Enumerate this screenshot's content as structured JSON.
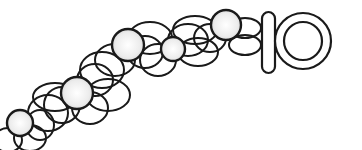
{
  "illustration": {
    "subject": "pearl necklace with toggle clasp",
    "colors": {
      "stroke": "#1a1a1a",
      "pearl_fill_center": "#ffffff",
      "pearl_fill_edge": "#d9d9d9",
      "background": "#ffffff"
    },
    "pearls": [
      {
        "cx": 20,
        "cy": 123,
        "r": 13
      },
      {
        "cx": 77,
        "cy": 93,
        "r": 16
      },
      {
        "cx": 128,
        "cy": 45,
        "r": 16
      },
      {
        "cx": 173,
        "cy": 49,
        "r": 12
      },
      {
        "cx": 226,
        "cy": 25,
        "r": 15
      }
    ],
    "links": [
      {
        "cx": 8,
        "cy": 140,
        "rx": 14,
        "ry": 12
      },
      {
        "cx": 30,
        "cy": 138,
        "rx": 16,
        "ry": 13
      },
      {
        "cx": 40,
        "cy": 125,
        "rx": 14,
        "ry": 15
      },
      {
        "cx": 48,
        "cy": 113,
        "rx": 20,
        "ry": 18
      },
      {
        "cx": 62,
        "cy": 105,
        "rx": 18,
        "ry": 18
      },
      {
        "cx": 55,
        "cy": 97,
        "rx": 22,
        "ry": 14
      },
      {
        "cx": 90,
        "cy": 108,
        "rx": 18,
        "ry": 16
      },
      {
        "cx": 95,
        "cy": 80,
        "rx": 18,
        "ry": 16
      },
      {
        "cx": 102,
        "cy": 70,
        "rx": 22,
        "ry": 18
      },
      {
        "cx": 108,
        "cy": 95,
        "rx": 22,
        "ry": 16
      },
      {
        "cx": 115,
        "cy": 60,
        "rx": 20,
        "ry": 16
      },
      {
        "cx": 145,
        "cy": 52,
        "rx": 18,
        "ry": 16
      },
      {
        "cx": 150,
        "cy": 38,
        "rx": 22,
        "ry": 16
      },
      {
        "cx": 158,
        "cy": 60,
        "rx": 18,
        "ry": 16
      },
      {
        "cx": 188,
        "cy": 40,
        "rx": 20,
        "ry": 16
      },
      {
        "cx": 195,
        "cy": 30,
        "rx": 22,
        "ry": 14
      },
      {
        "cx": 198,
        "cy": 52,
        "rx": 20,
        "ry": 14
      },
      {
        "cx": 210,
        "cy": 38,
        "rx": 16,
        "ry": 14
      },
      {
        "cx": 245,
        "cy": 28,
        "rx": 16,
        "ry": 10
      },
      {
        "cx": 245,
        "cy": 45,
        "rx": 16,
        "ry": 10
      }
    ],
    "toggle_bar": {
      "x": 262,
      "y": 12,
      "width": 13,
      "height": 61,
      "rx": 6.5
    },
    "toggle_ring": {
      "cx": 303,
      "cy": 41,
      "r_outer": 28,
      "r_inner": 19
    }
  }
}
